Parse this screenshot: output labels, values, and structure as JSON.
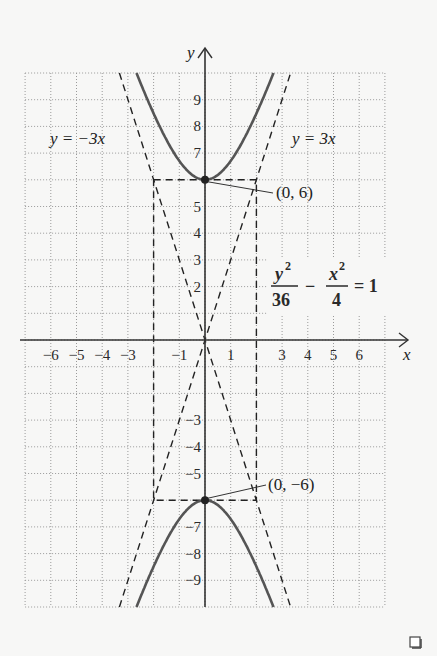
{
  "chart_data": {
    "type": "line",
    "title": "",
    "xlabel": "x",
    "ylabel": "y",
    "xlim": [
      -7,
      7
    ],
    "ylim": [
      -10,
      10
    ],
    "grid": true,
    "x_tick_labels": [
      "-6",
      "-5",
      "-4",
      "-3",
      "-1",
      "1",
      "3",
      "4",
      "5",
      "6"
    ],
    "y_tick_labels": [
      "9",
      "8",
      "7",
      "5",
      "4",
      "3",
      "2",
      "-3",
      "-4",
      "-5",
      "-7",
      "-8",
      "-9"
    ],
    "series": [
      {
        "name": "hyperbola y^2/36 - x^2/4 = 1 (upper branch)",
        "style": "solid",
        "points": [
          [
            -2.67,
            10
          ],
          [
            -2,
            8.49
          ],
          [
            -1,
            6.71
          ],
          [
            0,
            6
          ],
          [
            1,
            6.71
          ],
          [
            2,
            8.49
          ],
          [
            2.67,
            10
          ]
        ]
      },
      {
        "name": "hyperbola y^2/36 - x^2/4 = 1 (lower branch)",
        "style": "solid",
        "points": [
          [
            -2.67,
            -10
          ],
          [
            -2,
            -8.49
          ],
          [
            -1,
            -6.71
          ],
          [
            0,
            -6
          ],
          [
            1,
            -6.71
          ],
          [
            2,
            -8.49
          ],
          [
            2.67,
            -10
          ]
        ]
      },
      {
        "name": "y = 3x",
        "style": "dashed",
        "points": [
          [
            -3.33,
            -10
          ],
          [
            3.33,
            10
          ]
        ]
      },
      {
        "name": "y = -3x",
        "style": "dashed",
        "points": [
          [
            -3.33,
            10
          ],
          [
            3.33,
            -10
          ]
        ]
      },
      {
        "name": "central rectangle",
        "style": "dashed",
        "points": [
          [
            -2,
            6
          ],
          [
            2,
            6
          ],
          [
            2,
            -6
          ],
          [
            -2,
            -6
          ],
          [
            -2,
            6
          ]
        ]
      }
    ],
    "annotations": [
      {
        "text": "y = -3x",
        "x": -5.2,
        "y": 8.2
      },
      {
        "text": "y = 3x",
        "x": 4.1,
        "y": 8.2
      },
      {
        "text": "(0, 6)",
        "point": [
          0,
          6
        ]
      },
      {
        "text": "(0, -6)",
        "point": [
          0,
          -6
        ]
      },
      {
        "text": "y^2/36 - x^2/4 = 1",
        "x": 4.5,
        "y": 1.9
      }
    ],
    "vertices": [
      [
        0,
        6
      ],
      [
        0,
        -6
      ]
    ]
  },
  "labels": {
    "y_axis": "y",
    "x_axis": "x",
    "asym_neg": "y = −3x",
    "asym_pos": "y = 3x",
    "vertex_top": "(0, 6)",
    "vertex_bottom": "(0, −6)",
    "eq_num1": "y",
    "eq_den1": "36",
    "eq_num2": "x",
    "eq_den2": "4",
    "eq_exp": "2",
    "eq_minus": "−",
    "eq_rhs": "= 1",
    "end_mark": "end-of-proof-square-icon"
  },
  "ticks": {
    "x": [
      {
        "v": -6,
        "t": "−6"
      },
      {
        "v": -5,
        "t": "−5"
      },
      {
        "v": -4,
        "t": "−4"
      },
      {
        "v": -3,
        "t": "−3"
      },
      {
        "v": -1,
        "t": "−1"
      },
      {
        "v": 1,
        "t": "1"
      },
      {
        "v": 3,
        "t": "3"
      },
      {
        "v": 4,
        "t": "4"
      },
      {
        "v": 5,
        "t": "5"
      },
      {
        "v": 6,
        "t": "6"
      }
    ],
    "y": [
      {
        "v": 9,
        "t": "9"
      },
      {
        "v": 8,
        "t": "8"
      },
      {
        "v": 7,
        "t": "7"
      },
      {
        "v": 5,
        "t": "5"
      },
      {
        "v": 4,
        "t": "4"
      },
      {
        "v": 3,
        "t": "3"
      },
      {
        "v": 2,
        "t": "2"
      },
      {
        "v": -3,
        "t": "−3"
      },
      {
        "v": -4,
        "t": "−4"
      },
      {
        "v": -5,
        "t": "−5"
      },
      {
        "v": -7,
        "t": "−7"
      },
      {
        "v": -8,
        "t": "−8"
      },
      {
        "v": -9,
        "t": "−9"
      }
    ]
  },
  "colors": {
    "curve": "#555555",
    "axis": "#333333",
    "grid": "#9a9a9a",
    "dash": "#222222",
    "background": "#f7f7f6"
  }
}
